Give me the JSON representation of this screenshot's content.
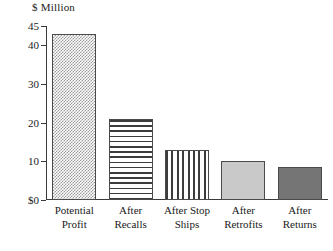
{
  "chart_data": {
    "type": "bar",
    "title": "$ Million",
    "subtitle": "",
    "xlabel": "",
    "ylabel": "$ Million",
    "ylim": [
      0,
      45
    ],
    "grid": false,
    "legend": "none",
    "categories": [
      "Potential\nProfit",
      "After\nRecalls",
      "After Stop\nShips",
      "After\nRetrofits",
      "After\nReturns"
    ],
    "values": [
      43,
      21,
      13,
      10,
      8.6
    ],
    "ytick_labels": [
      "45",
      "40",
      "30",
      "20",
      "10",
      "$0"
    ],
    "ytick_values": [
      45,
      40,
      30,
      20,
      10,
      0
    ],
    "bar_fills": [
      "dotted",
      "horizontal-lines",
      "vertical-lines",
      "light-gray-solid",
      "dark-gray-solid"
    ],
    "colors": {
      "axis": "#3a3a3a",
      "bar_outline": "#4a4a4a",
      "pattern_ink": "#3c3c3c",
      "light_gray": "#c9c9c9",
      "dark_gray": "#757575",
      "background": "#ffffff",
      "text": "#1a1a1a"
    }
  }
}
